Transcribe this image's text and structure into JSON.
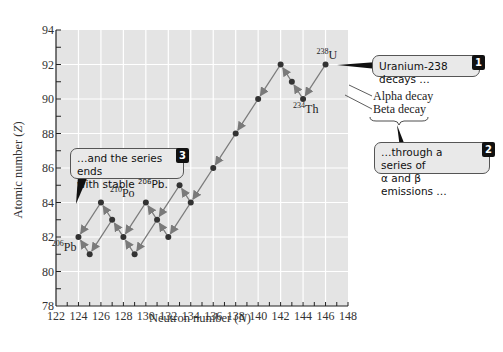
{
  "chart_data": {
    "type": "scatter",
    "title": "",
    "xlabel": "Neutron number (N)",
    "xlabel_main": "Neutron number (",
    "xlabel_var": "N",
    "xlabel_end": ")",
    "ylabel": "Atomic number (Z)",
    "ylabel_main": "Atomic number (",
    "ylabel_var": "Z",
    "ylabel_end": ")",
    "xlim": [
      122,
      148
    ],
    "ylim": [
      78,
      94
    ],
    "x_ticks": [
      122,
      124,
      126,
      128,
      130,
      132,
      134,
      136,
      138,
      140,
      142,
      144,
      146,
      148
    ],
    "y_ticks": [
      78,
      80,
      82,
      84,
      86,
      88,
      90,
      92,
      94
    ],
    "grid": true,
    "points": [
      {
        "id": "U238",
        "N": 146,
        "Z": 92
      },
      {
        "id": "Th234",
        "N": 144,
        "Z": 90
      },
      {
        "id": "Pa234",
        "N": 143,
        "Z": 91
      },
      {
        "id": "U234",
        "N": 142,
        "Z": 92
      },
      {
        "id": "Th230",
        "N": 140,
        "Z": 90
      },
      {
        "id": "Ra226",
        "N": 138,
        "Z": 88
      },
      {
        "id": "Rn222",
        "N": 136,
        "Z": 86
      },
      {
        "id": "Po218",
        "N": 134,
        "Z": 84
      },
      {
        "id": "At218",
        "N": 133,
        "Z": 85
      },
      {
        "id": "Pb214",
        "N": 132,
        "Z": 82
      },
      {
        "id": "Bi214",
        "N": 131,
        "Z": 83
      },
      {
        "id": "Po214",
        "N": 130,
        "Z": 84
      },
      {
        "id": "Tl210",
        "N": 129,
        "Z": 81
      },
      {
        "id": "Pb210",
        "N": 128,
        "Z": 82
      },
      {
        "id": "Bi210",
        "N": 127,
        "Z": 83
      },
      {
        "id": "Po210",
        "N": 126,
        "Z": 84
      },
      {
        "id": "Tl206",
        "N": 125,
        "Z": 81
      },
      {
        "id": "Pb206",
        "N": 124,
        "Z": 82
      }
    ],
    "decays": [
      {
        "from": "U238",
        "to": "Th234",
        "type": "alpha"
      },
      {
        "from": "Th234",
        "to": "Pa234",
        "type": "beta"
      },
      {
        "from": "Pa234",
        "to": "U234",
        "type": "beta"
      },
      {
        "from": "U234",
        "to": "Th230",
        "type": "alpha"
      },
      {
        "from": "Th230",
        "to": "Ra226",
        "type": "alpha"
      },
      {
        "from": "Ra226",
        "to": "Rn222",
        "type": "alpha"
      },
      {
        "from": "Rn222",
        "to": "Po218",
        "type": "alpha"
      },
      {
        "from": "Po218",
        "to": "Pb214",
        "type": "alpha"
      },
      {
        "from": "Po218",
        "to": "At218",
        "type": "beta"
      },
      {
        "from": "At218",
        "to": "Bi214",
        "type": "alpha"
      },
      {
        "from": "Pb214",
        "to": "Bi214",
        "type": "beta"
      },
      {
        "from": "Bi214",
        "to": "Po214",
        "type": "beta"
      },
      {
        "from": "Bi214",
        "to": "Tl210",
        "type": "alpha"
      },
      {
        "from": "Po214",
        "to": "Pb210",
        "type": "alpha"
      },
      {
        "from": "Tl210",
        "to": "Pb210",
        "type": "beta"
      },
      {
        "from": "Pb210",
        "to": "Bi210",
        "type": "beta"
      },
      {
        "from": "Bi210",
        "to": "Po210",
        "type": "beta"
      },
      {
        "from": "Bi210",
        "to": "Tl206",
        "type": "alpha"
      },
      {
        "from": "Po210",
        "to": "Pb206",
        "type": "alpha"
      },
      {
        "from": "Tl206",
        "to": "Pb206",
        "type": "beta"
      }
    ],
    "point_labels": [
      {
        "point": "U238",
        "mass": "238",
        "symbol": "U"
      },
      {
        "point": "Th234",
        "mass": "234",
        "symbol": "Th"
      },
      {
        "point": "Po210",
        "mass": "210",
        "symbol": "Po"
      },
      {
        "point": "Pb206",
        "mass": "206",
        "symbol": "Pb"
      }
    ],
    "legend": {
      "alpha": "Alpha decay",
      "beta": "Beta decay",
      "position": "right"
    },
    "colors": {
      "plot_background": "#e4e4e4",
      "grid": "#ffffff",
      "arrow": "#7a7a7a",
      "point": "#333333"
    }
  },
  "callouts": [
    {
      "number": "1",
      "text": "Uranium-238 decays …"
    },
    {
      "number": "2",
      "line1": "…through a series of",
      "line2": "α and β emissions …"
    },
    {
      "number": "3",
      "line1": "…and the series ends",
      "line2_pre": "with stable ",
      "line2_sup": "206",
      "line2_post": "Pb."
    }
  ]
}
